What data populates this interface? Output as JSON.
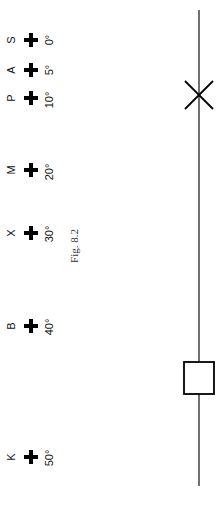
{
  "figure": {
    "caption": "Fig. 8.2",
    "line_color": "#222222",
    "ink_color": "#000000"
  },
  "marks": [
    {
      "letter": "S",
      "angle": "0°",
      "y": 40
    },
    {
      "letter": "A",
      "angle": "5°",
      "y": 70
    },
    {
      "letter": "P",
      "angle": "10°",
      "y": 98
    },
    {
      "letter": "M",
      "angle": "20°",
      "y": 170
    },
    {
      "letter": "X",
      "angle": "30°",
      "y": 233
    },
    {
      "letter": "B",
      "angle": "40°",
      "y": 326
    },
    {
      "letter": "K",
      "angle": "50°",
      "y": 457
    }
  ],
  "scale_line": {
    "x": 199,
    "y_start": 10,
    "y_end": 486,
    "cross_marker": {
      "cx": 199,
      "cy": 95,
      "half_size": 14
    },
    "square_marker": {
      "x": 184,
      "y": 362,
      "width": 30,
      "height": 32
    }
  }
}
